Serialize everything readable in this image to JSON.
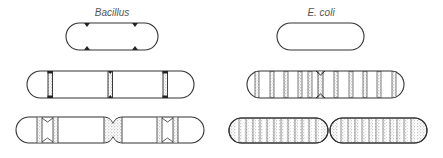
{
  "diagram": {
    "type": "cell-wall-growth-comparison",
    "columns": [
      {
        "id": "bacillus",
        "label": "Bacillus",
        "label_x": 112,
        "stages": [
          {
            "stage": 1,
            "description": "newborn cell with growth zones marked at poles of future septa"
          },
          {
            "stage": 2,
            "description": "elongated cell with three localized septal growth bands"
          },
          {
            "stage": 3,
            "description": "dividing cell constricting at center, paired new wall zones"
          }
        ]
      },
      {
        "id": "ecoli",
        "label": "E. coli",
        "label_x": 321,
        "stages": [
          {
            "stage": 1,
            "description": "newborn cell, unmarked wall"
          },
          {
            "stage": 2,
            "description": "elongated cell with dispersed wall insertion bands along length"
          },
          {
            "stage": 3,
            "description": "dividing cell with wall insertion dispersed throughout both daughters"
          }
        ]
      }
    ],
    "colors": {
      "outline": "#333333",
      "stipple": "#9a9a9a",
      "background": "#ffffff"
    }
  }
}
